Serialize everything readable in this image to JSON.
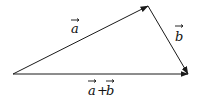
{
  "diagram": {
    "type": "vector-addition-triangle",
    "stroke_color": "#1a1a1a",
    "background": "#ffffff",
    "points": {
      "origin": [
        13,
        74
      ],
      "a_tip": [
        148,
        6
      ],
      "b_tip": [
        188,
        74
      ]
    },
    "vectors": [
      {
        "id": "a",
        "label": "a",
        "from": "origin",
        "to": "a_tip"
      },
      {
        "id": "b",
        "label": "b",
        "from": "a_tip",
        "to": "b_tip"
      },
      {
        "id": "a_plus_b",
        "label": "a+b",
        "from": "origin",
        "to": "b_tip"
      }
    ],
    "labels": {
      "a": "a",
      "b": "b",
      "sum_a": "a",
      "sum_plus": "+",
      "sum_b": "b"
    }
  }
}
